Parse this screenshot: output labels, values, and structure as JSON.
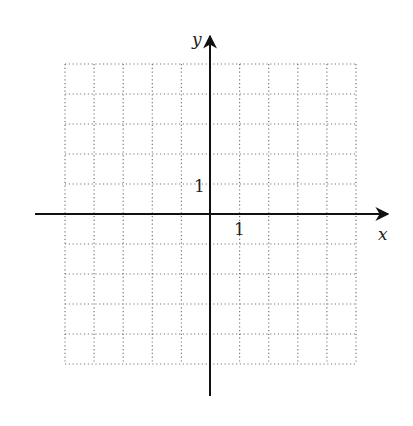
{
  "diagram": {
    "type": "coordinate-grid",
    "x_axis_label": "x",
    "y_axis_label": "y",
    "x_tick_label": "1",
    "y_tick_label": "1",
    "grid": {
      "columns": 10,
      "rows": 10,
      "x_min": -5,
      "x_max": 5,
      "y_min": -5,
      "y_max": 5,
      "style": "dotted"
    },
    "colors": {
      "axis": "#111111",
      "grid": "#777777",
      "background": "#ffffff"
    }
  }
}
